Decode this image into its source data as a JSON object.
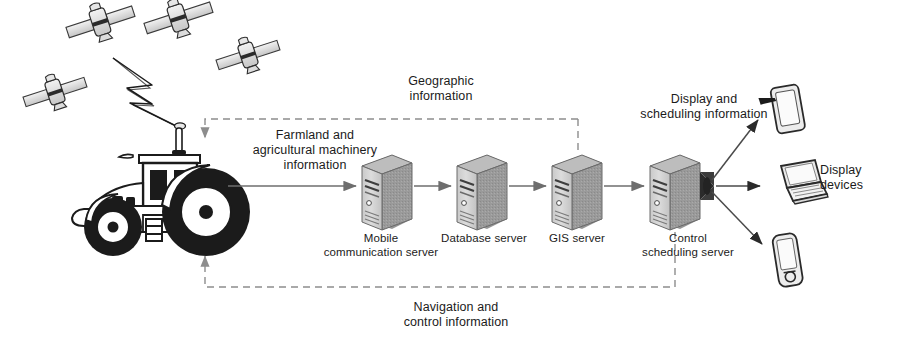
{
  "diagram": {
    "nodes": {
      "tractor": {
        "name": "tractor-with-gps-antenna"
      },
      "satellites": [
        {
          "name": "satellite-1"
        },
        {
          "name": "satellite-2"
        },
        {
          "name": "satellite-3"
        },
        {
          "name": "satellite-4"
        }
      ],
      "servers": [
        {
          "id": "mobile",
          "label": "Mobile\ncommunication server"
        },
        {
          "id": "database",
          "label": "Database server"
        },
        {
          "id": "gis",
          "label": "GIS server"
        },
        {
          "id": "control",
          "label": "Control\nscheduling server"
        }
      ],
      "devices": [
        {
          "id": "tablet",
          "name": "tablet-icon"
        },
        {
          "id": "laptop",
          "name": "laptop-icon"
        },
        {
          "id": "phone",
          "name": "smartphone-icon"
        }
      ],
      "devices_label": "Display\ndevices"
    },
    "flow_labels": {
      "uplink": "Farmland and\nagricultural machinery\ninformation",
      "geographic": "Geographic\ninformation",
      "display_scheduling": "Display and\nscheduling information",
      "navigation": "Navigation and\ncontrol information"
    },
    "colors": {
      "line": "#6e6e6e",
      "dashed": "#8d8d8d",
      "server_front": "#d2d2d2",
      "server_side": "#9a9a9a",
      "server_top": "#b4b4b4",
      "ink": "#1b1b1b",
      "device_fill": "#ececed"
    }
  }
}
